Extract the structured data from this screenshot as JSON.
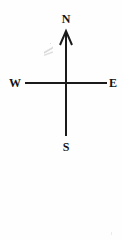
{
  "figure": {
    "width": 122,
    "height": 240,
    "background_color": "#fefefe",
    "ink_color": "#1a1a1a"
  },
  "compass": {
    "center": {
      "x": 66,
      "y": 83
    },
    "labels": {
      "north": "N",
      "south": "S",
      "east": "E",
      "west": "W"
    },
    "axes": {
      "vertical": {
        "x": 66,
        "top_y": 32,
        "bottom_y": 136,
        "stroke_width": 2
      },
      "horizontal": {
        "y": 83,
        "left_x": 25,
        "right_x": 107,
        "stroke_width": 2
      }
    },
    "arrowhead": {
      "shape": "open-chevron",
      "points_to": "N",
      "tip": {
        "x": 66,
        "y": 31
      },
      "half_width": 6,
      "height": 14,
      "stroke_width": 2
    },
    "artifacts": {
      "smudge_label": "scan-smudge",
      "speck_label": "scan-speck"
    }
  }
}
